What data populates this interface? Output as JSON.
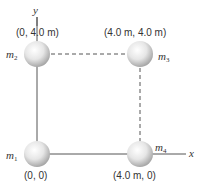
{
  "diagram": {
    "axes": {
      "x_label": "x",
      "y_label": "y"
    },
    "masses": [
      {
        "id": "m1",
        "symbol": "m",
        "subscript": "1",
        "coord_label": "(0, 0)"
      },
      {
        "id": "m2",
        "symbol": "m",
        "subscript": "2",
        "coord_label": "(0, 4.0 m)"
      },
      {
        "id": "m3",
        "symbol": "m",
        "subscript": "3",
        "coord_label": "(4.0 m, 4.0 m)"
      },
      {
        "id": "m4",
        "symbol": "m",
        "subscript": "4",
        "coord_label": "(4.0 m, 0)"
      }
    ],
    "colors": {
      "line": "#555555",
      "text": "#333333",
      "sphere_light": "#ffffff",
      "sphere_dark": "#b8b8b8"
    }
  }
}
